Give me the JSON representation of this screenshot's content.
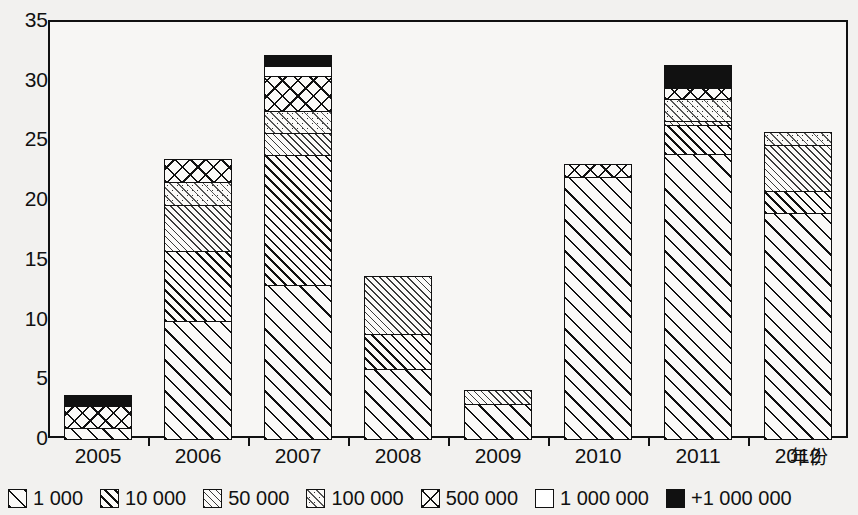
{
  "chart_data": {
    "type": "bar",
    "stacked": true,
    "title": "",
    "subtitle": "",
    "xlabel": "年份",
    "ylabel": "",
    "ylim": [
      0,
      35
    ],
    "ytick_step": 5,
    "yticks": [
      "35",
      "30",
      "25",
      "20",
      "15",
      "10",
      "5",
      "0"
    ],
    "grid": false,
    "legend_position": "bottom",
    "categories": [
      "2005",
      "2006",
      "2007",
      "2008",
      "2009",
      "2010",
      "2011",
      "2012"
    ],
    "series": [
      {
        "name": "1 000",
        "pattern": "diagonal-wide-hatch",
        "values": [
          1,
          10,
          13,
          6,
          3,
          22,
          24,
          19
        ]
      },
      {
        "name": "10 000",
        "pattern": "diagonal-dense-hatch",
        "values": [
          0,
          6,
          11,
          3,
          0,
          0,
          2.5,
          2
        ]
      },
      {
        "name": "50 000",
        "pattern": "light-fine-hatch",
        "values": [
          0,
          4,
          2,
          5,
          1.3,
          0,
          0.5,
          4
        ]
      },
      {
        "name": "100 000",
        "pattern": "dotted-hatch",
        "values": [
          0,
          2,
          2,
          0,
          0,
          0,
          2,
          1.2
        ]
      },
      {
        "name": "500 000",
        "pattern": "crosshatch",
        "values": [
          2,
          2,
          3,
          0,
          0,
          1.2,
          1,
          0
        ]
      },
      {
        "name": "1 000 000",
        "pattern": "solid-white",
        "values": [
          0,
          0,
          1,
          0,
          0,
          0,
          0,
          0
        ]
      },
      {
        "name": "+1 000 000",
        "pattern": "solid-black",
        "values": [
          1,
          0,
          1,
          0,
          0,
          0,
          2,
          0
        ]
      }
    ],
    "totals": [
      4,
      24,
      33,
      14,
      4.3,
      33.2,
      32,
      26.2
    ]
  },
  "legend": {
    "items": [
      {
        "label": "1 000",
        "swatch": "diagonal-wide-hatch"
      },
      {
        "label": "10 000",
        "swatch": "diagonal-dense-hatch"
      },
      {
        "label": "50 000",
        "swatch": "light-fine-hatch"
      },
      {
        "label": "100 000",
        "swatch": "dotted-hatch"
      },
      {
        "label": "500 000",
        "swatch": "crosshatch"
      },
      {
        "label": "1 000 000",
        "swatch": "solid-white"
      },
      {
        "label": "+1 000 000",
        "swatch": "solid-black"
      }
    ]
  },
  "axis": {
    "x_title": "年份",
    "y_ticks": [
      "35",
      "30",
      "25",
      "20",
      "15",
      "10",
      "5",
      "0"
    ],
    "x_categories": [
      "2005",
      "2006",
      "2007",
      "2008",
      "2009",
      "2010",
      "2011",
      "2012"
    ]
  },
  "colors": {
    "ink": "#111111",
    "paper": "#f2f1ef",
    "plot_bg": "#f7f6f4"
  }
}
